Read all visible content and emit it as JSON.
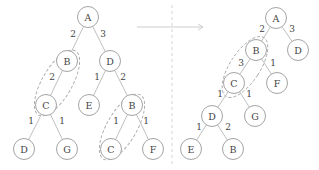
{
  "diagram": {
    "title": "",
    "colors": {
      "node_stroke": "#9a9a9a",
      "edge": "#b8b8b8",
      "text": "#444444",
      "dashed": "#a8a8a8"
    },
    "left_tree": {
      "nodes": [
        {
          "id": "A",
          "label": "A",
          "x": 88,
          "y": 17
        },
        {
          "id": "B",
          "label": "B",
          "x": 67,
          "y": 61
        },
        {
          "id": "D",
          "label": "D",
          "x": 110,
          "y": 61
        },
        {
          "id": "C",
          "label": "C",
          "x": 46,
          "y": 105
        },
        {
          "id": "E",
          "label": "E",
          "x": 89,
          "y": 105
        },
        {
          "id": "B2",
          "label": "B",
          "x": 132,
          "y": 105
        },
        {
          "id": "D2",
          "label": "D",
          "x": 24,
          "y": 149
        },
        {
          "id": "G",
          "label": "G",
          "x": 67,
          "y": 149
        },
        {
          "id": "C2",
          "label": "C",
          "x": 111,
          "y": 149
        },
        {
          "id": "F",
          "label": "F",
          "x": 153,
          "y": 149
        }
      ],
      "edges": [
        {
          "from": "A",
          "to": "B",
          "weight": "2",
          "lx": 73,
          "ly": 34
        },
        {
          "from": "A",
          "to": "D",
          "weight": "3",
          "lx": 103,
          "ly": 34
        },
        {
          "from": "B",
          "to": "C",
          "weight": "2",
          "lx": 52,
          "ly": 77
        },
        {
          "from": "D",
          "to": "E",
          "weight": "1",
          "lx": 97,
          "ly": 77
        },
        {
          "from": "D",
          "to": "B2",
          "weight": "2",
          "lx": 123,
          "ly": 77
        },
        {
          "from": "C",
          "to": "D2",
          "weight": "1",
          "lx": 31,
          "ly": 121
        },
        {
          "from": "C",
          "to": "G",
          "weight": "1",
          "lx": 62,
          "ly": 121
        },
        {
          "from": "B2",
          "to": "C2",
          "weight": "1",
          "lx": 116,
          "ly": 121
        },
        {
          "from": "B2",
          "to": "F",
          "weight": "1",
          "lx": 146,
          "ly": 121
        }
      ],
      "groups": [
        {
          "cx": 57,
          "cy": 83,
          "rx": 15,
          "ry": 37,
          "rotate": 30
        },
        {
          "cx": 122,
          "cy": 127,
          "rx": 15,
          "ry": 37,
          "rotate": 30
        }
      ]
    },
    "right_tree": {
      "nodes": [
        {
          "id": "A",
          "label": "A",
          "x": 276,
          "y": 18
        },
        {
          "id": "B",
          "label": "B",
          "x": 256,
          "y": 50
        },
        {
          "id": "D",
          "label": "D",
          "x": 298,
          "y": 50
        },
        {
          "id": "C",
          "label": "C",
          "x": 234,
          "y": 83
        },
        {
          "id": "F",
          "label": "F",
          "x": 277,
          "y": 83
        },
        {
          "id": "D3",
          "label": "D",
          "x": 212,
          "y": 116
        },
        {
          "id": "G",
          "label": "G",
          "x": 255,
          "y": 116
        },
        {
          "id": "E",
          "label": "E",
          "x": 191,
          "y": 149
        },
        {
          "id": "B3",
          "label": "B",
          "x": 233,
          "y": 149
        }
      ],
      "edges": [
        {
          "from": "A",
          "to": "B",
          "weight": "2",
          "lx": 262,
          "ly": 29
        },
        {
          "from": "A",
          "to": "D",
          "weight": "3",
          "lx": 292,
          "ly": 29
        },
        {
          "from": "B",
          "to": "C",
          "weight": "3",
          "lx": 241,
          "ly": 63
        },
        {
          "from": "B",
          "to": "F",
          "weight": "1",
          "lx": 273,
          "ly": 63
        },
        {
          "from": "C",
          "to": "D3",
          "weight": "1",
          "lx": 220,
          "ly": 94
        },
        {
          "from": "C",
          "to": "G",
          "weight": "1",
          "lx": 249,
          "ly": 94
        },
        {
          "from": "D3",
          "to": "E",
          "weight": "1",
          "lx": 199,
          "ly": 127
        },
        {
          "from": "D3",
          "to": "B3",
          "weight": "2",
          "lx": 228,
          "ly": 127
        }
      ],
      "groups": [
        {
          "cx": 245,
          "cy": 67,
          "rx": 15,
          "ry": 35,
          "rotate": 33
        }
      ]
    },
    "transform_arrow": {
      "x1": 137,
      "y1": 27,
      "x2": 203,
      "y2": 27
    },
    "divider": {
      "x": 172,
      "y1": 5,
      "y2": 165
    }
  }
}
